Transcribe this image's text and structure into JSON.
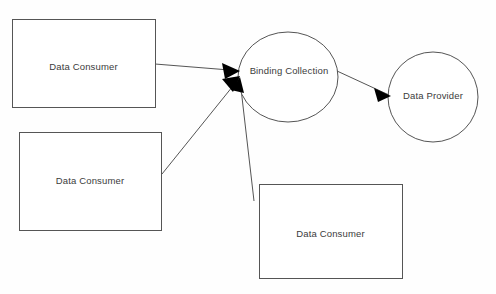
{
  "diagram": {
    "background_color": "#fefefe",
    "stroke_color": "#555555",
    "text_color": "#3b3b3b",
    "arrow_color": "#000000",
    "nodes": [
      {
        "id": "consumer-top",
        "label": "Data Consumer",
        "shape": "rectangle",
        "x": 12,
        "y": 19,
        "width": 143,
        "height": 88,
        "label_x": 83,
        "label_y": 67
      },
      {
        "id": "consumer-middle",
        "label": "Data Consumer",
        "shape": "rectangle",
        "x": 19,
        "y": 132,
        "width": 142,
        "height": 98,
        "label_x": 90,
        "label_y": 181
      },
      {
        "id": "consumer-bottom",
        "label": "Data Consumer",
        "shape": "rectangle",
        "x": 259,
        "y": 184,
        "width": 143,
        "height": 94,
        "label_x": 331,
        "label_y": 234
      },
      {
        "id": "binding-collection",
        "label": "Binding Collection",
        "shape": "circle",
        "cx": 288,
        "cy": 77,
        "rx": 50,
        "ry": 45,
        "label_x": 289,
        "label_y": 71
      },
      {
        "id": "data-provider",
        "label": "Data Provider",
        "shape": "circle",
        "cx": 433,
        "cy": 97,
        "rx": 45,
        "ry": 45,
        "label_x": 433,
        "label_y": 96
      }
    ],
    "edges": [
      {
        "id": "edge-consumer-top-to-binding",
        "from": "consumer-top",
        "to": "binding-collection",
        "x1": 155,
        "y1": 64,
        "x2": 240,
        "y2": 71,
        "arrowhead": "end"
      },
      {
        "id": "edge-consumer-middle-to-binding",
        "from": "consumer-middle",
        "to": "binding-collection",
        "x1": 162,
        "y1": 174,
        "x2": 240,
        "y2": 76,
        "arrowhead": "end"
      },
      {
        "id": "edge-consumer-bottom-to-binding",
        "from": "consumer-bottom",
        "to": "binding-collection",
        "x1": 254,
        "y1": 201,
        "x2": 240,
        "y2": 79,
        "arrowhead": "end"
      },
      {
        "id": "edge-binding-to-provider",
        "from": "binding-collection",
        "to": "data-provider",
        "x1": 337,
        "y1": 71,
        "x2": 390,
        "y2": 95,
        "arrowhead": "end"
      }
    ]
  }
}
